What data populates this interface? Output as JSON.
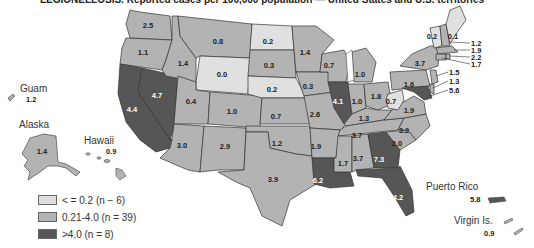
{
  "title": "LEGIONELLOSIS. Reported cases per 100,000 population — United States and U.S. territories",
  "colors": {
    "low": "#e0e0e0",
    "mid": "#b3b3b3",
    "high": "#565656",
    "border": "#333333",
    "lake": "#ffffff"
  },
  "legend": [
    {
      "label": "< = 0.2 (n − 6)",
      "color": "#e0e0e0"
    },
    {
      "label": "0.21-4.0 (n = 39)",
      "color": "#b3b3b3"
    },
    {
      "label": ">4.0 (n = 8)",
      "color": "#565656"
    }
  ],
  "territories": {
    "guam": {
      "name": "Guam",
      "value": "1.2"
    },
    "alaska": {
      "name": "Alaska",
      "value": "1.4"
    },
    "hawaii": {
      "name": "Hawaii",
      "value": "0.9"
    },
    "puerto_rico": {
      "name": "Puerto Rico",
      "value": "5.8"
    },
    "virgin_islands": {
      "name": "Virgin Is.",
      "value": "0.9"
    }
  },
  "states": {
    "WA": "2.5",
    "OR": "1.1",
    "CA": "4.4",
    "NV": "4.7",
    "ID": "1.4",
    "MT": "0.8",
    "WY": "0.0",
    "UT": "0.4",
    "CO": "1.0",
    "AZ": "3.0",
    "NM": "2.9",
    "ND": "0.2",
    "SD": "0.3",
    "NE": "0.2",
    "KS": "0.7",
    "OK": "1.2",
    "TX": "3.9",
    "MN": "1.4",
    "IA": "0.3",
    "MO": "2.6",
    "AR": "1.9",
    "LA": "6.2",
    "WI": "0.7",
    "IL": "4.1",
    "MI": "1.0",
    "IN": "1.0",
    "OH": "1.8",
    "KY": "1.3",
    "TN": "3.7",
    "MS": "1.7",
    "AL": "3.7",
    "GA": "7.3",
    "FL": "4.2",
    "SC": "2.0",
    "NC": "3.2",
    "VA": "1.9",
    "WV": "0.7",
    "PA": "1.6",
    "NY": "3.7",
    "VT": "0.2",
    "ME": "0.1",
    "NH": "1.2",
    "MA": "1.9",
    "RI": "2.2",
    "CT": "1.7",
    "NJ": "1.5",
    "DE": "1.3",
    "MD": "5.6"
  }
}
